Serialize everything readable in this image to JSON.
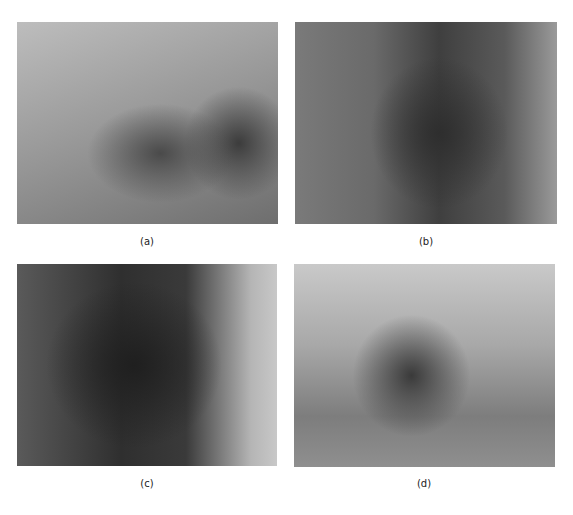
{
  "figure": {
    "panels": [
      {
        "id": "a",
        "label": "(a)",
        "content": "surgical-photograph"
      },
      {
        "id": "b",
        "label": "(b)",
        "content": "surgical-photograph"
      },
      {
        "id": "c",
        "label": "(c)",
        "content": "surgical-photograph"
      },
      {
        "id": "d",
        "label": "(d)",
        "content": "surgical-photograph"
      }
    ]
  }
}
